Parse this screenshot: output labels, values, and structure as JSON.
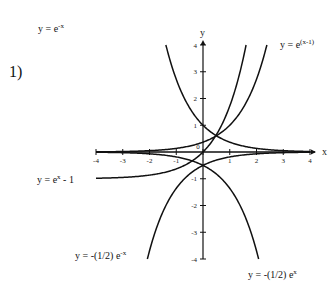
{
  "problem_number": "1)",
  "chart_data": {
    "type": "line",
    "title": "",
    "xlabel": "x",
    "ylabel": "y",
    "xlim": [
      -4,
      4
    ],
    "ylim": [
      -4,
      4
    ],
    "x_ticks": [
      -4,
      -3,
      -2,
      -1,
      0,
      1,
      2,
      3,
      4
    ],
    "y_ticks": [
      -4,
      -3,
      -2,
      -1,
      1,
      2,
      3,
      4
    ],
    "grid": false,
    "series": [
      {
        "name": "y = e^-x",
        "label_base": "y = e",
        "label_sup": "-x",
        "label_tail": "",
        "points": [
          [
            -1.39,
            4
          ],
          [
            -1,
            2.718
          ],
          [
            -0.5,
            1.649
          ],
          [
            0,
            1
          ],
          [
            0.5,
            0.607
          ],
          [
            1,
            0.368
          ],
          [
            2,
            0.135
          ],
          [
            3,
            0.05
          ],
          [
            4,
            0.018
          ]
        ]
      },
      {
        "name": "y = e^(x-1)",
        "label_base": "y = e",
        "label_sup": "(x-1)",
        "label_tail": "",
        "points": [
          [
            -4,
            0.007
          ],
          [
            -3,
            0.018
          ],
          [
            -2,
            0.05
          ],
          [
            -1,
            0.135
          ],
          [
            0,
            0.368
          ],
          [
            0.5,
            0.607
          ],
          [
            1,
            1
          ],
          [
            2,
            2.718
          ],
          [
            2.39,
            4
          ]
        ]
      },
      {
        "name": "y = e^x - 1",
        "label_base": "y = e",
        "label_sup": "x",
        "label_tail": " - 1",
        "points": [
          [
            -4,
            -0.982
          ],
          [
            -3,
            -0.95
          ],
          [
            -2,
            -0.865
          ],
          [
            -1,
            -0.632
          ],
          [
            0,
            0
          ],
          [
            0.5,
            0.649
          ],
          [
            1,
            1.718
          ],
          [
            1.61,
            4
          ]
        ]
      },
      {
        "name": "y = -(1/2) e^-x",
        "label_base": "y = -(1/2) e",
        "label_sup": "-x",
        "label_tail": "",
        "points": [
          [
            -2.08,
            -4
          ],
          [
            -1,
            -1.359
          ],
          [
            0,
            -0.5
          ],
          [
            1,
            -0.184
          ],
          [
            2,
            -0.068
          ],
          [
            3,
            -0.025
          ],
          [
            4,
            -0.009
          ]
        ]
      },
      {
        "name": "y = -(1/2) e^x",
        "label_base": "y = -(1/2) e",
        "label_sup": "x",
        "label_tail": "",
        "points": [
          [
            -4,
            -0.009
          ],
          [
            -3,
            -0.025
          ],
          [
            -2,
            -0.068
          ],
          [
            -1,
            -0.184
          ],
          [
            0,
            -0.5
          ],
          [
            1,
            -1.359
          ],
          [
            2.08,
            -4
          ]
        ]
      }
    ]
  }
}
